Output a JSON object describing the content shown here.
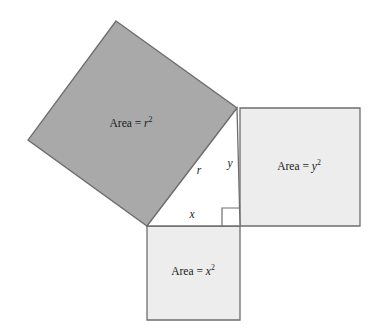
{
  "figure": {
    "name": "pythagorean-theorem-squares-diagram",
    "width": 377,
    "height": 333,
    "background_color": "#ffffff"
  },
  "colors": {
    "hypotenuse_square_fill": "#a9a9a9",
    "leg_square_fill": "#ededed",
    "stroke": "#6e6e6e",
    "text": "#1a1a1a",
    "background": "#ffffff"
  },
  "squares": [
    {
      "id": "hypotenuse-square",
      "label_text": "Area = ",
      "label_variable": "r",
      "label_exponent": "2",
      "label_full": "Area = r²",
      "fill": "#a9a9a9",
      "side_variable": "r",
      "label_x": 131,
      "label_y": 124,
      "points": "116,21 237,108 147,226 28,140"
    },
    {
      "id": "vertical-leg-square",
      "label_text": "Area = ",
      "label_variable": "y",
      "label_exponent": "2",
      "label_full": "Area = y²",
      "fill": "#ededed",
      "side_variable": "y",
      "label_x": 299,
      "label_y": 167,
      "points": "240,108 360,108 360,226 240,226"
    },
    {
      "id": "horizontal-leg-square",
      "label_text": "Area = ",
      "label_variable": "x",
      "label_exponent": "2",
      "label_full": "Area = x²",
      "fill": "#ededed",
      "side_variable": "x",
      "label_x": 193,
      "label_y": 272,
      "points": "147,226 240,226 240,320 147,320"
    }
  ],
  "triangle": {
    "id": "right-triangle",
    "points": "147,226 240,226 237,108",
    "fill": "#ffffff",
    "right_angle_vertex": "240,226",
    "right_angle_marker_points": "222,226 222,208 240,208"
  },
  "side_labels": [
    {
      "id": "hypotenuse-label",
      "text": "r",
      "x": 199,
      "y": 171
    },
    {
      "id": "vertical-leg-label",
      "text": "y",
      "x": 230,
      "y": 164
    },
    {
      "id": "horizontal-leg-label",
      "text": "x",
      "x": 192,
      "y": 215
    }
  ]
}
